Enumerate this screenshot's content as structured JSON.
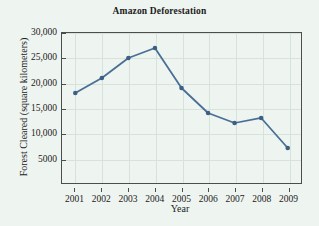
{
  "chart_data": {
    "type": "line",
    "title": "Amazon Deforestation",
    "xlabel": "Year",
    "ylabel": "Forest Cleared (square kilometers)",
    "x": [
      2001,
      2002,
      2003,
      2004,
      2005,
      2006,
      2007,
      2008,
      2009
    ],
    "categories": [
      "2001",
      "2002",
      "2003",
      "2004",
      "2005",
      "2006",
      "2007",
      "2008",
      "2009"
    ],
    "values": [
      18000,
      21000,
      25000,
      27000,
      19000,
      14000,
      12000,
      13000,
      7000
    ],
    "series": [
      {
        "name": "Forest Cleared",
        "values": [
          18000,
          21000,
          25000,
          27000,
          19000,
          14000,
          12000,
          13000,
          7000
        ]
      }
    ],
    "ylim": [
      0,
      30000
    ],
    "xlim": [
      2000.5,
      2009.5
    ],
    "ytick_values": [
      5000,
      10000,
      15000,
      20000,
      25000,
      30000
    ],
    "ytick_labels": [
      "5000",
      "10,000",
      "15,000",
      "20,000",
      "25,000",
      "30,000"
    ],
    "xtick_labels": [
      "2001",
      "2002",
      "2003",
      "2004",
      "2005",
      "2006",
      "2007",
      "2008",
      "2009"
    ],
    "grid": true,
    "legend": false,
    "legend_position": "none",
    "marker": "filled-circle",
    "colors": {
      "line": "#4a6f96",
      "marker": "#3c5f85",
      "axis": "#4d4d4d",
      "grid": "#d7e2da",
      "background": "#eef4ef",
      "text": "#1b1b1b"
    }
  }
}
